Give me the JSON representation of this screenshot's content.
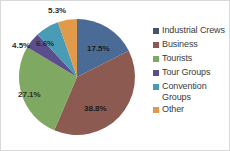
{
  "chart_data": {
    "type": "pie",
    "title": "",
    "legend_position": "right",
    "categories": [
      "Industrial Crews",
      "Business",
      "Tourists",
      "Tour Groups",
      "Convention Groups",
      "Other"
    ],
    "values": [
      17.5,
      38.8,
      27.1,
      4.5,
      6.6,
      5.3
    ],
    "value_labels": [
      "17.5%",
      "38.8%",
      "27.1%",
      "4.5%",
      "6.6%",
      "5.3%"
    ],
    "colors": [
      "#4A6B96",
      "#8C5A50",
      "#7FA862",
      "#5B4E8C",
      "#4A9BB5",
      "#E09A4A"
    ],
    "units": "percent",
    "data_labels_shown": true,
    "grid": false
  },
  "legend": {
    "items": [
      {
        "label": "Industrial Crews",
        "color": "#44546A"
      },
      {
        "label": "Business",
        "color": "#8C5A50"
      },
      {
        "label": "Tourists",
        "color": "#7FA862"
      },
      {
        "label": "Tour Groups",
        "color": "#5B4E8C"
      },
      {
        "label": "Convention Groups",
        "color": "#4A9BB5"
      },
      {
        "label": "Other",
        "color": "#E09A4A"
      }
    ]
  },
  "labels": {
    "industrial_crews": "17.5%",
    "business": "38.8%",
    "tourists": "27.1%",
    "tour_groups": "4.5%",
    "convention_groups": "6.6%",
    "other": "5.3%"
  }
}
